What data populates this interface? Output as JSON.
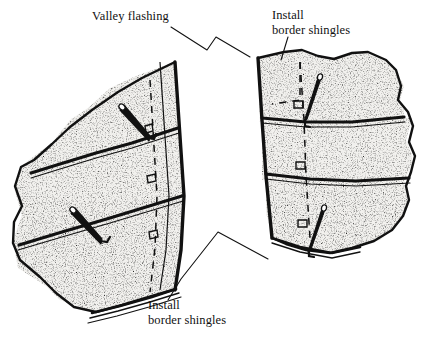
{
  "figure": {
    "background_color": "#ffffff",
    "ink_color": "#111111",
    "shingle_fill": "#f2f1ee",
    "stipple_color": "#2b2b2b"
  },
  "labels": {
    "valley_flashing": {
      "text": "Valley flashing",
      "lines": [
        "Valley flashing"
      ],
      "x": 92,
      "y": 20
    },
    "install_border_shingles_top": {
      "line1": "Install",
      "line2": "border shingles",
      "x": 272,
      "y": 18
    },
    "install_border_shingles_bottom": {
      "line1": "Install",
      "line2": "border shingles",
      "x": 148,
      "y": 307
    }
  },
  "leader_lines": [
    {
      "name": "valley-flashing-leader",
      "points": "172,26 206,49 215,36 249,56"
    },
    {
      "name": "install-top-leader",
      "points": "287,38 281,59"
    },
    {
      "name": "install-bottom-leader",
      "points": "169,301 180,281 217,232 267,259"
    }
  ],
  "planes": {
    "left": {
      "name": "left-roof-plane",
      "courses": 3,
      "description": "Left roof plane with three stippled shingle courses angled down-left"
    },
    "right": {
      "name": "right-roof-plane",
      "courses": 3,
      "description": "Right roof plane with three stippled shingle courses angled down-right"
    }
  },
  "elements": {
    "valley_flashing_strip": "Narrow strip along the valley with dashed chalk line",
    "chalk_line": "dashed",
    "chalk_marks": 5,
    "shingle_tabs": 4
  }
}
